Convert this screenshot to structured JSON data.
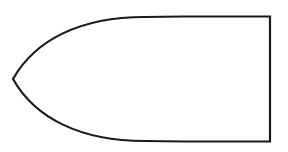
{
  "diagram": {
    "shape": "bullet-outline",
    "stroke_color": "#1a1a1a",
    "fill_color": "#ffffff"
  }
}
